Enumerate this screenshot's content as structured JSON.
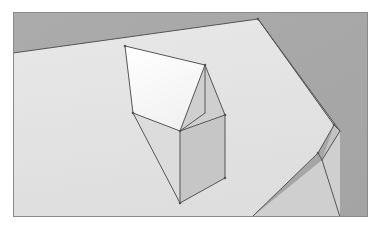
{
  "scene": {
    "title": "3D shaded polyhedron rendering",
    "canvas": {
      "width": 383,
      "height": 233
    },
    "frame": {
      "name": "image-frame",
      "x": 13,
      "y": 12,
      "width": 355,
      "height": 205,
      "border_color": "#8a8a8a",
      "border_width": 1,
      "margin_color": "#ffffff"
    },
    "palette": {
      "background_gray": "#a9a9a9",
      "ground_top": "#e3e3e3",
      "ground_side_light": "#d5d5d5",
      "ground_side_dark": "#c3c3c3",
      "roof_highlight": "#ffffff",
      "roof_gable": "#cfcfcf",
      "wall_left": "#dcdcdc",
      "wall_right": "#c6c6c6",
      "edge_line": "#555555",
      "edge_line_soft": "#7a7a7a"
    },
    "objects": [
      {
        "name": "background-plane",
        "kind": "background",
        "fill": "#a9a9a9",
        "points": "13,12 368,12 368,217 13,217"
      },
      {
        "name": "ground-plane-top",
        "kind": "face",
        "label": "ground top surface",
        "fill": "#e3e3e3",
        "points": "13,53 258,19 334,125 318,153 252,217 13,217"
      },
      {
        "name": "ground-plane-side-right",
        "kind": "face",
        "label": "ground right bevel",
        "fill": "#c3c3c3",
        "points": "258,19 340,131 322,160 334,125"
      },
      {
        "name": "ground-plane-side-front",
        "kind": "face",
        "label": "ground front bevel",
        "fill": "#cfcfcf",
        "points": "322,160 340,131 340,217 252,217"
      },
      {
        "name": "solid-roof-highlight",
        "kind": "face",
        "label": "bright roof slope",
        "fill": "#ffffff",
        "points": "125,46 205,65 180,131 133,113"
      },
      {
        "name": "solid-roof-gable",
        "kind": "face",
        "label": "shaded gable triangle",
        "fill": "#cfcfcf",
        "points": "205,65 225,115 180,131"
      },
      {
        "name": "solid-wall-left",
        "kind": "face",
        "label": "left wall of prism",
        "fill": "#dcdcdc",
        "points": "133,113 180,131 180,203"
      },
      {
        "name": "solid-wall-right",
        "kind": "face",
        "label": "right wall of prism",
        "fill": "#c6c6c6",
        "points": "180,131 225,115 225,178 180,203"
      }
    ],
    "edges": [
      {
        "name": "ground-edge-back-left",
        "from": "13,53",
        "to": "258,19",
        "weight": 1
      },
      {
        "name": "ground-edge-back-right",
        "from": "258,19",
        "to": "334,125",
        "weight": 1
      },
      {
        "name": "ground-edge-right-bevel",
        "from": "334,125",
        "to": "318,153",
        "weight": 1
      },
      {
        "name": "ground-edge-front",
        "from": "318,153",
        "to": "252,217",
        "weight": 1
      },
      {
        "name": "ground-bevel-outer-top",
        "from": "258,19",
        "to": "340,131",
        "weight": 1
      },
      {
        "name": "ground-bevel-outer-mid",
        "from": "340,131",
        "to": "322,160",
        "weight": 1
      },
      {
        "name": "ground-bevel-outer-low",
        "from": "322,160",
        "to": "340,217",
        "weight": 1
      },
      {
        "name": "ground-bevel-crease",
        "from": "334,125",
        "to": "340,131",
        "weight": 1
      },
      {
        "name": "ground-bevel-crease-2",
        "from": "318,153",
        "to": "322,160",
        "weight": 1
      },
      {
        "name": "roof-ridge-left",
        "from": "125,46",
        "to": "205,65",
        "weight": 1
      },
      {
        "name": "roof-eave-left",
        "from": "125,46",
        "to": "133,113",
        "weight": 1
      },
      {
        "name": "roof-slope-front",
        "from": "133,113",
        "to": "180,131",
        "weight": 1
      },
      {
        "name": "roof-slope-right",
        "from": "205,65",
        "to": "180,131",
        "weight": 1
      },
      {
        "name": "gable-vertical",
        "from": "205,65",
        "to": "205,113",
        "weight": 1
      },
      {
        "name": "gable-edge-right",
        "from": "205,65",
        "to": "225,115",
        "weight": 1
      },
      {
        "name": "gable-base",
        "from": "180,131",
        "to": "225,115",
        "weight": 1
      },
      {
        "name": "gable-base-inner",
        "from": "180,131",
        "to": "205,113",
        "weight": 1
      },
      {
        "name": "wall-front-vertical",
        "from": "180,131",
        "to": "180,203",
        "weight": 1
      },
      {
        "name": "wall-right-vertical",
        "from": "225,115",
        "to": "225,178",
        "weight": 1
      },
      {
        "name": "wall-bottom-right",
        "from": "180,203",
        "to": "225,178",
        "weight": 1
      },
      {
        "name": "wall-left-diagonal",
        "from": "133,113",
        "to": "180,203",
        "weight": 1
      }
    ],
    "vertices": [
      {
        "name": "vertex-roof-back-left",
        "x": 125,
        "y": 46
      },
      {
        "name": "vertex-roof-ridge",
        "x": 205,
        "y": 65
      },
      {
        "name": "vertex-roof-eave-left",
        "x": 133,
        "y": 113
      },
      {
        "name": "vertex-roof-front",
        "x": 180,
        "y": 131
      },
      {
        "name": "vertex-wall-right-top",
        "x": 225,
        "y": 115
      },
      {
        "name": "vertex-wall-right-bot",
        "x": 225,
        "y": 178
      },
      {
        "name": "vertex-wall-front-bot",
        "x": 180,
        "y": 203
      },
      {
        "name": "vertex-ground-back",
        "x": 258,
        "y": 19
      },
      {
        "name": "vertex-ground-right",
        "x": 334,
        "y": 125
      },
      {
        "name": "vertex-ground-front",
        "x": 318,
        "y": 153
      }
    ]
  }
}
